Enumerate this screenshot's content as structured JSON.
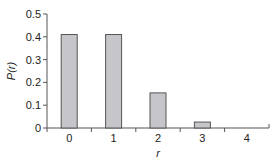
{
  "chart_data": {
    "type": "bar",
    "title": "",
    "xlabel": "r",
    "ylabel": "P(r)",
    "categories": [
      "0",
      "1",
      "2",
      "3",
      "4"
    ],
    "values": [
      0.41,
      0.41,
      0.154,
      0.026,
      0.002
    ],
    "ylim": [
      0,
      0.5
    ],
    "yticks": [
      "0",
      "0.1",
      "0.2",
      "0.3",
      "0.4",
      "0.5"
    ],
    "ytick_values": [
      0,
      0.1,
      0.2,
      0.3,
      0.4,
      0.5
    ],
    "grid": false,
    "legend": null,
    "colors": {
      "bar_fill": "#c6c6ca",
      "bar_stroke": "#555555",
      "axis": "#555555",
      "text": "#222222"
    }
  }
}
